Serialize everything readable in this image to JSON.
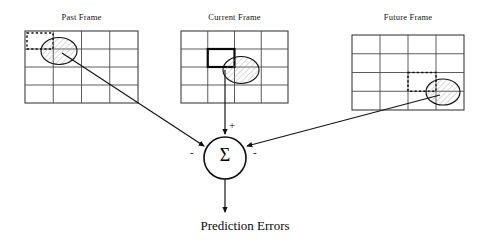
{
  "figure": {
    "output_label": "Prediction Errors",
    "sigma_symbol": "Σ",
    "sign_plus": "+",
    "sign_minus_left": "-",
    "sign_minus_right": "-"
  },
  "frames": [
    {
      "id": "past",
      "label": "Past Frame",
      "grid": {
        "cols": 4,
        "rows": 4
      },
      "marker": {
        "type": "dashed-rectangle",
        "col": 1,
        "row": 1
      },
      "blob": {
        "type": "hatched-circle",
        "col": 2,
        "row": 2
      },
      "connector": {
        "sign": "-",
        "to": "summation-node"
      }
    },
    {
      "id": "current",
      "label": "Current Frame",
      "grid": {
        "cols": 4,
        "rows": 4
      },
      "marker": {
        "type": "solid-bold-rectangle",
        "col": 2,
        "row": 2
      },
      "blob": {
        "type": "hatched-circle",
        "col": 3,
        "row": 3
      },
      "connector": {
        "sign": "+",
        "to": "summation-node"
      }
    },
    {
      "id": "future",
      "label": "Future Frame",
      "grid": {
        "cols": 4,
        "rows": 4
      },
      "marker": {
        "type": "dashed-rectangle",
        "col": 3,
        "row": 3
      },
      "blob": {
        "type": "hatched-circle",
        "col": 4,
        "row": 3
      },
      "connector": {
        "sign": "-",
        "to": "summation-node"
      }
    }
  ],
  "colors": {
    "stroke": "#1a1a1a",
    "grid": "#4a4a4a",
    "background": "#ffffff",
    "hatch": "#8a8a8a"
  }
}
